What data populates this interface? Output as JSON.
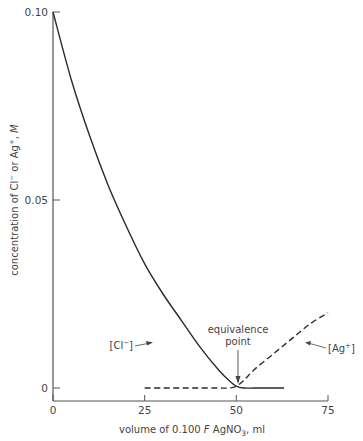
{
  "chart_data": {
    "type": "line",
    "title": "",
    "xlabel": "volume of 0.100 F AgNO3, ml",
    "xlabel_parts": {
      "pre": "volume of 0.100 ",
      "italic": "F",
      "mid": " AgNO",
      "sub": "3",
      "post": ", ml"
    },
    "ylabel": "concentration of Cl⁻ or Ag⁺, M",
    "ylabel_parts": {
      "pre": "concentration of Cl",
      "sup1": "−",
      "mid": " or Ag",
      "sup2": "+",
      "post": ", ",
      "italic": "M"
    },
    "xlim": [
      0,
      75
    ],
    "ylim": [
      0,
      0.1
    ],
    "x_ticks": [
      "0",
      "25",
      "50",
      "75"
    ],
    "y_ticks": [
      "0",
      "0.05",
      "0.10"
    ],
    "grid": false,
    "series": [
      {
        "name": "[Cl⁻]",
        "style": "solid",
        "x": [
          0,
          5,
          10,
          15,
          20,
          25,
          30,
          35,
          40,
          45,
          48,
          50,
          52,
          55,
          60,
          63
        ],
        "y": [
          0.1,
          0.082,
          0.067,
          0.054,
          0.043,
          0.033,
          0.025,
          0.018,
          0.011,
          0.005,
          0.002,
          0.0005,
          0.0,
          0.0,
          0.0,
          0.0
        ]
      },
      {
        "name": "[Ag⁺]",
        "style": "dashed",
        "x": [
          25,
          30,
          35,
          40,
          45,
          48,
          50,
          52,
          55,
          60,
          65,
          70,
          75
        ],
        "y": [
          0.0,
          0.0,
          0.0,
          0.0,
          0.0,
          0.0,
          0.0005,
          0.002,
          0.005,
          0.009,
          0.013,
          0.017,
          0.02
        ]
      }
    ],
    "annotations": [
      {
        "text": "equivalence",
        "text2": "point",
        "x": 50,
        "y": 0,
        "arrow": "down"
      },
      {
        "text": "[Cl⁻]",
        "label_pre": "[Cl",
        "label_sup": "−",
        "label_post": "]",
        "points_to_series": 0
      },
      {
        "text": "[Ag⁺]",
        "label_pre": "[Ag",
        "label_sup": "+",
        "label_post": "]",
        "points_to_series": 1
      }
    ]
  }
}
